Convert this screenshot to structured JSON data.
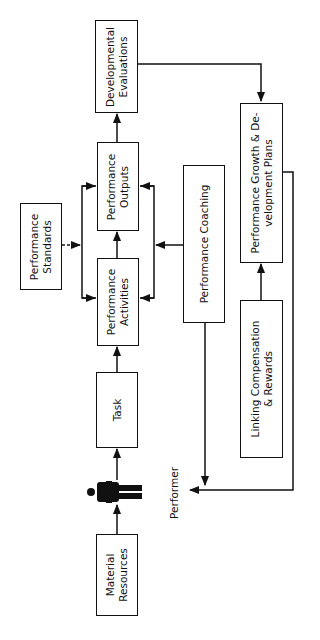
{
  "diagram": {
    "type": "flowchart",
    "orientation": "rotated-90-ccw",
    "nodes": {
      "developmental_evaluations": {
        "line1": "Developmental",
        "line2": "Evaluations"
      },
      "performance_outputs": {
        "line1": "Performance",
        "line2": "Outputs"
      },
      "performance_activities": {
        "line1": "Performance",
        "line2": "Activities"
      },
      "performance_standards": {
        "line1": "Performance",
        "line2": "Standards"
      },
      "task": {
        "line1": "Task"
      },
      "performer_icon": {
        "icon": "person-icon"
      },
      "material_resources": {
        "line1": "Material",
        "line2": "Resources"
      },
      "performance_coaching": {
        "line1": "Performance Coaching"
      },
      "growth_plans": {
        "line1": "Performance Growth & De-",
        "line2": "velopment Plans"
      },
      "compensation_rewards": {
        "line1": "Linking Compensation",
        "line2": "& Rewards"
      }
    },
    "labels": {
      "performer": "Performer"
    },
    "edges": [
      {
        "from": "Material Resources",
        "to": "Performer (person)"
      },
      {
        "from": "Performer (person)",
        "to": "Task"
      },
      {
        "from": "Task",
        "to": "Performance Activities"
      },
      {
        "from": "Performance Activities",
        "to": "Performance Outputs"
      },
      {
        "from": "Performance Outputs",
        "to": "Developmental Evaluations"
      },
      {
        "from": "Performance Standards",
        "to": "Performance Activities & Outputs",
        "style": "dashed"
      },
      {
        "from": "Performance Coaching",
        "to": "Performance Activities & Outputs"
      },
      {
        "from": "Developmental Evaluations",
        "to": "Performance Growth & Development Plans"
      },
      {
        "from": "Linking Compensation & Rewards",
        "to": "Performance Growth & Development Plans"
      },
      {
        "from": "Performance Coaching",
        "to": "Performer"
      },
      {
        "from": "Performance Growth & Development Plans",
        "to": "Performer"
      }
    ]
  }
}
